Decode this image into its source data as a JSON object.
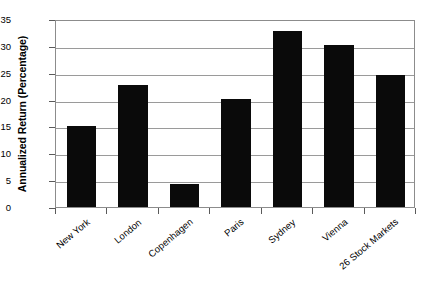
{
  "chart_data": {
    "type": "bar",
    "title": "",
    "xlabel": "",
    "ylabel": "Annualized Return (Percentage)",
    "categories": [
      "New York",
      "London",
      "Copenhagen",
      "Paris",
      "Sydney",
      "Vienna",
      "26 Stock Markets"
    ],
    "values": [
      15.0,
      22.8,
      4.2,
      20.1,
      32.8,
      30.1,
      24.5
    ],
    "ylim": [
      0,
      35
    ],
    "ytick_labels": [
      "0",
      "5",
      "10",
      "15",
      "20",
      "25",
      "30",
      "35"
    ],
    "ytick_values": [
      0,
      5,
      10,
      15,
      20,
      25,
      30,
      35
    ],
    "grid": "horizontal",
    "legend": "none",
    "bar_color": "#0a0a0a",
    "gridline_color": "#9a9a9a",
    "axis_color": "#8c8c8c",
    "background_color": "#ffffff"
  }
}
